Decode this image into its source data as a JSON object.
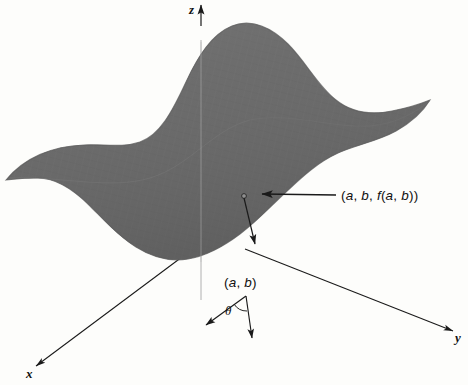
{
  "figure": {
    "type": "3d-surface-diagram",
    "background_color": "#fdfdfb",
    "surface_color": "#6b6b6b",
    "line_color": "#1a1a1a"
  },
  "axes": {
    "x": {
      "label": "x",
      "direction": "down-left",
      "tip": [
        33,
        368
      ],
      "origin": [
        179,
        259
      ]
    },
    "y": {
      "label": "y",
      "direction": "down-right",
      "tip": [
        456,
        333
      ],
      "origin": [
        245,
        249
      ]
    },
    "z": {
      "label": "z",
      "direction": "up",
      "tip": [
        201,
        3
      ],
      "origin": [
        201,
        300
      ]
    }
  },
  "annotations": {
    "surface_point": {
      "label": "(a, b, f(a, b))",
      "label_pos": [
        344,
        196
      ],
      "marker": [
        244,
        196
      ],
      "arrow_from": [
        336,
        196
      ],
      "arrow_to": [
        258,
        194
      ]
    },
    "domain_point": {
      "label": "(a, b)",
      "label_pos": [
        226,
        277
      ],
      "vertex": [
        246,
        296
      ]
    },
    "angle": {
      "label": "θ",
      "label_pos": [
        228,
        306
      ],
      "ray_one_tip": [
        203,
        326
      ],
      "ray_two_tip": [
        253,
        342
      ]
    },
    "vertical_connector": {
      "from": [
        244,
        197
      ],
      "to": [
        254,
        249
      ]
    }
  },
  "chart_data": {
    "type": "surface",
    "title": "",
    "xlabel": "x",
    "ylabel": "y",
    "zlabel": "z",
    "legend": "none",
    "grid": false
  }
}
